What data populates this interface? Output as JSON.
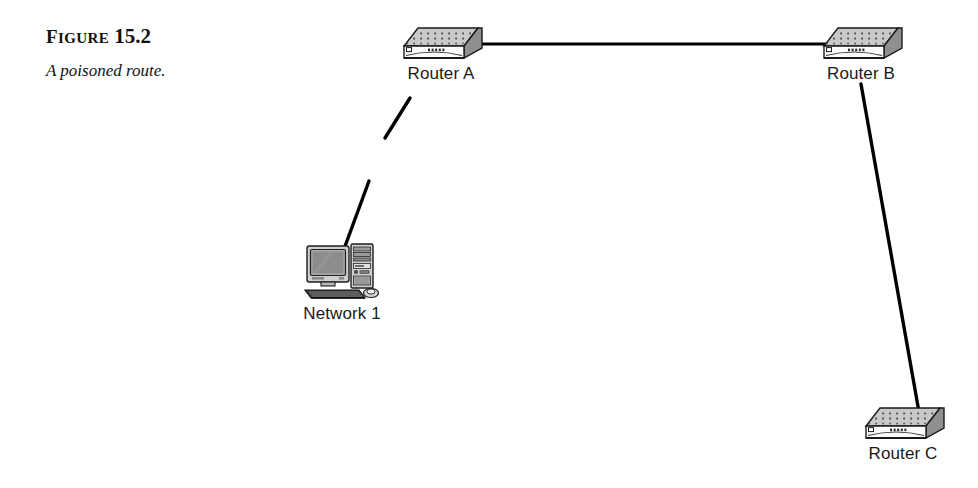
{
  "figure": {
    "label_word": "Figure",
    "label_word_cap": "F",
    "label_word_rest": "igure",
    "number": "15.2",
    "title": "A poisoned route."
  },
  "diagram": {
    "type": "network-topology",
    "background_color": "#ffffff",
    "line_color": "#000000",
    "nodes": [
      {
        "id": "router-a",
        "label": "Router A",
        "icon": "router-icon",
        "x": 441,
        "y": 46
      },
      {
        "id": "router-b",
        "label": "Router B",
        "icon": "router-icon",
        "x": 861,
        "y": 46
      },
      {
        "id": "router-c",
        "label": "Router C",
        "icon": "router-icon",
        "x": 903,
        "y": 426
      },
      {
        "id": "network-1",
        "label": "Network 1",
        "icon": "workstation-icon",
        "x": 342,
        "y": 273
      }
    ],
    "links": [
      {
        "id": "link-a-b",
        "from": "router-a",
        "to": "router-b",
        "state": "connected",
        "broken": false
      },
      {
        "id": "link-b-c",
        "from": "router-b",
        "to": "router-c",
        "state": "connected",
        "broken": false
      },
      {
        "id": "link-a-network-1",
        "from": "router-a",
        "to": "network-1",
        "state": "poisoned",
        "broken": true
      }
    ]
  }
}
